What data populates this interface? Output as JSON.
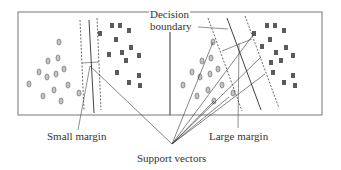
{
  "labels": {
    "decision_boundary_line1": "Decision",
    "decision_boundary_line2": "boundary",
    "small_margin": "Small margin",
    "large_margin": "Large margin",
    "support_vectors": "Support vectors"
  },
  "colors": {
    "circle_fill": "#b8b8b8",
    "circle_stroke": "#777777",
    "square_fill": "#555555",
    "line": "#444444",
    "frame": "#666666"
  },
  "panels": [
    {
      "name": "small-margin-panel",
      "x": 18,
      "y": 12,
      "w": 152,
      "h": 103
    },
    {
      "name": "large-margin-panel",
      "x": 170,
      "y": 12,
      "w": 152,
      "h": 103
    }
  ]
}
